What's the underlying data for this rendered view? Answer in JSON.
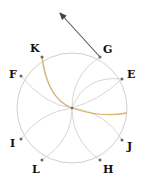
{
  "diagram": {
    "circle": {
      "cx": 72,
      "cy": 108,
      "r": 55,
      "color": "#cfcfcf"
    },
    "center": {
      "x": 72,
      "y": 108
    },
    "points": [
      {
        "id": "K",
        "label": "K",
        "x": 42,
        "y": 57,
        "lx": 30,
        "ly": 52
      },
      {
        "id": "G",
        "label": "G",
        "x": 100,
        "y": 57,
        "lx": 103,
        "ly": 53
      },
      {
        "id": "F",
        "label": "F",
        "x": 21,
        "y": 76,
        "lx": 9,
        "ly": 78
      },
      {
        "id": "E",
        "label": "E",
        "x": 122,
        "y": 79,
        "lx": 127,
        "ly": 78
      },
      {
        "id": "I",
        "label": "I",
        "x": 21,
        "y": 139,
        "lx": 10,
        "ly": 147
      },
      {
        "id": "J",
        "label": "J",
        "x": 122,
        "y": 140,
        "lx": 127,
        "ly": 150
      },
      {
        "id": "L",
        "label": "L",
        "x": 42,
        "y": 160,
        "lx": 32,
        "ly": 173
      },
      {
        "id": "H",
        "label": "H",
        "x": 100,
        "y": 160,
        "lx": 103,
        "ly": 173
      }
    ],
    "arrow": {
      "from": "G",
      "x1": 100,
      "y1": 57,
      "x2": 59,
      "y2": 12,
      "color": "#555555"
    },
    "highlight_curve_color": "#d9b36a",
    "arc_color": "#d4d4d4"
  }
}
